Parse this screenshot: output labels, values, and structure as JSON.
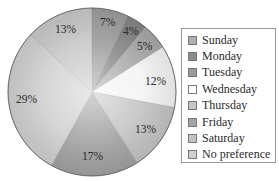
{
  "chart_data": {
    "type": "pie",
    "title": "",
    "start_angle": "12 o'clock",
    "direction": "clockwise",
    "categories": [
      "Sunday",
      "Monday",
      "Tuesday",
      "Wednesday",
      "Thursday",
      "Friday",
      "Saturday",
      "No preference"
    ],
    "values": [
      7,
      4,
      5,
      12,
      13,
      17,
      29,
      13
    ],
    "labels": [
      "7%",
      "4%",
      "5%",
      "12%",
      "13%",
      "17%",
      "29%",
      "13%"
    ],
    "colors": [
      "#9d9d9d",
      "#858585",
      "#a8a8a8",
      "#f4f4f4",
      "#c4c4c4",
      "#a2a2a2",
      "#d0d0d0",
      "#c8c8c8"
    ],
    "legend_position": "right",
    "grid": false
  },
  "legend": {
    "items": [
      {
        "label": "Sunday",
        "color": "#b0b0b0"
      },
      {
        "label": "Monday",
        "color": "#8c8c8c"
      },
      {
        "label": "Tuesday",
        "color": "#9a9a9a"
      },
      {
        "label": "Wednesday",
        "color": "#ffffff"
      },
      {
        "label": "Thursday",
        "color": "#c6c6c6"
      },
      {
        "label": "Friday",
        "color": "#a4a4a4"
      },
      {
        "label": "Saturday",
        "color": "#c2c2c2"
      },
      {
        "label": "No preference",
        "color": "#cfcfcf"
      }
    ]
  }
}
